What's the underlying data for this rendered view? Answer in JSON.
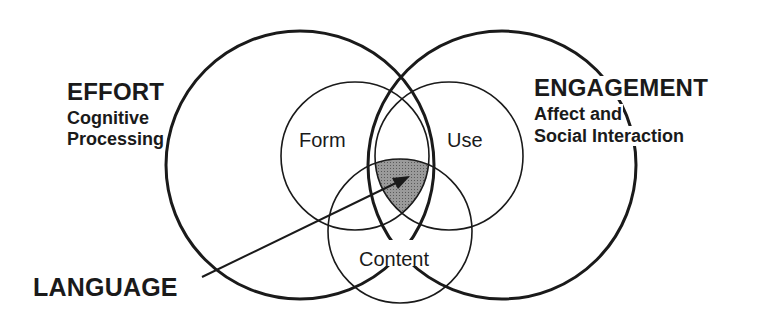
{
  "diagram": {
    "type": "venn",
    "outer_circles": [
      {
        "id": "effort",
        "title": "EFFORT",
        "subtitle_lines": [
          "Cognitive",
          "Processing"
        ]
      },
      {
        "id": "engagement",
        "title": "ENGAGEMENT",
        "subtitle_lines": [
          "Affect and",
          "Social Interaction"
        ]
      }
    ],
    "inner_circles": [
      {
        "id": "form",
        "label": "Form"
      },
      {
        "id": "use",
        "label": "Use"
      },
      {
        "id": "content",
        "label": "Content"
      }
    ],
    "pointer": {
      "label": "LANGUAGE",
      "target": "intersection of Form, Use and Content within Effort and Engagement"
    },
    "colors": {
      "stroke": "#1a1a1a",
      "shaded_region": "#8a8a8a",
      "background": "#ffffff"
    }
  },
  "labels": {
    "effort_title": "EFFORT",
    "effort_line1": "Cognitive",
    "effort_line2": "Processing",
    "engagement_title": "ENGAGEMENT",
    "engagement_line1": "Affect and",
    "engagement_line2": "Social Interaction",
    "form": "Form",
    "use": "Use",
    "content": "Content",
    "language": "LANGUAGE"
  }
}
